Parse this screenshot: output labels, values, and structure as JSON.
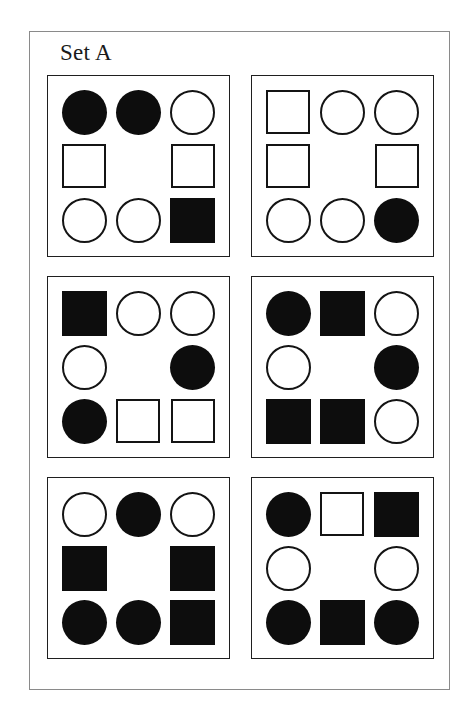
{
  "figure": {
    "caption": "Set A",
    "type": "shape-grid-plate",
    "panel_count": 6,
    "grid_rows": 3,
    "grid_columns": 3,
    "colors": {
      "filled": "#0d0d0d",
      "outline": "#141414",
      "background": "#ffffff",
      "outer_frame": "#8a8a8a",
      "panel_frame": "#1f1f1f"
    },
    "shape_vocabulary": [
      "circle",
      "square",
      "empty"
    ],
    "fill_vocabulary": [
      "filled",
      "open",
      "none"
    ]
  },
  "panels": [
    {
      "name": "panel-1",
      "position": "top-left",
      "cells": [
        {
          "shape": "circle",
          "fill": "filled"
        },
        {
          "shape": "circle",
          "fill": "filled"
        },
        {
          "shape": "circle",
          "fill": "open"
        },
        {
          "shape": "square",
          "fill": "open"
        },
        {
          "shape": "empty",
          "fill": "none"
        },
        {
          "shape": "square",
          "fill": "open"
        },
        {
          "shape": "circle",
          "fill": "open"
        },
        {
          "shape": "circle",
          "fill": "open"
        },
        {
          "shape": "square",
          "fill": "filled"
        }
      ]
    },
    {
      "name": "panel-2",
      "position": "top-right",
      "cells": [
        {
          "shape": "square",
          "fill": "open"
        },
        {
          "shape": "circle",
          "fill": "open"
        },
        {
          "shape": "circle",
          "fill": "open"
        },
        {
          "shape": "square",
          "fill": "open"
        },
        {
          "shape": "empty",
          "fill": "none"
        },
        {
          "shape": "square",
          "fill": "open"
        },
        {
          "shape": "circle",
          "fill": "open"
        },
        {
          "shape": "circle",
          "fill": "open"
        },
        {
          "shape": "circle",
          "fill": "filled"
        }
      ]
    },
    {
      "name": "panel-3",
      "position": "middle-left",
      "cells": [
        {
          "shape": "square",
          "fill": "filled"
        },
        {
          "shape": "circle",
          "fill": "open"
        },
        {
          "shape": "circle",
          "fill": "open"
        },
        {
          "shape": "circle",
          "fill": "open"
        },
        {
          "shape": "empty",
          "fill": "none"
        },
        {
          "shape": "circle",
          "fill": "filled"
        },
        {
          "shape": "circle",
          "fill": "filled"
        },
        {
          "shape": "square",
          "fill": "open"
        },
        {
          "shape": "square",
          "fill": "open"
        }
      ]
    },
    {
      "name": "panel-4",
      "position": "middle-right",
      "cells": [
        {
          "shape": "circle",
          "fill": "filled"
        },
        {
          "shape": "square",
          "fill": "filled"
        },
        {
          "shape": "circle",
          "fill": "open"
        },
        {
          "shape": "circle",
          "fill": "open"
        },
        {
          "shape": "empty",
          "fill": "none"
        },
        {
          "shape": "circle",
          "fill": "filled"
        },
        {
          "shape": "square",
          "fill": "filled"
        },
        {
          "shape": "square",
          "fill": "filled"
        },
        {
          "shape": "circle",
          "fill": "open"
        }
      ]
    },
    {
      "name": "panel-5",
      "position": "bottom-left",
      "cells": [
        {
          "shape": "circle",
          "fill": "open"
        },
        {
          "shape": "circle",
          "fill": "filled"
        },
        {
          "shape": "circle",
          "fill": "open"
        },
        {
          "shape": "square",
          "fill": "filled"
        },
        {
          "shape": "empty",
          "fill": "none"
        },
        {
          "shape": "square",
          "fill": "filled"
        },
        {
          "shape": "circle",
          "fill": "filled"
        },
        {
          "shape": "circle",
          "fill": "filled"
        },
        {
          "shape": "square",
          "fill": "filled"
        }
      ]
    },
    {
      "name": "panel-6",
      "position": "bottom-right",
      "cells": [
        {
          "shape": "circle",
          "fill": "filled"
        },
        {
          "shape": "square",
          "fill": "open"
        },
        {
          "shape": "square",
          "fill": "filled"
        },
        {
          "shape": "circle",
          "fill": "open"
        },
        {
          "shape": "empty",
          "fill": "none"
        },
        {
          "shape": "circle",
          "fill": "open"
        },
        {
          "shape": "circle",
          "fill": "filled"
        },
        {
          "shape": "square",
          "fill": "filled"
        },
        {
          "shape": "circle",
          "fill": "filled"
        }
      ]
    }
  ]
}
